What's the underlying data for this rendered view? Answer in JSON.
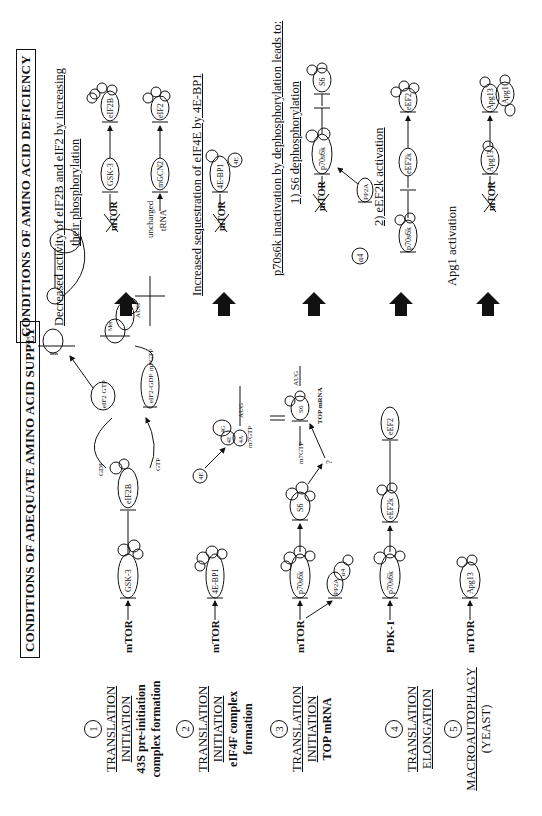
{
  "left_panel": {
    "title": "CONDITIONS OF ADEQUATE AMINO ACID SUPPLY",
    "sections": [
      {
        "number": "1",
        "line1": "TRANSLATION",
        "line2": "INITIATION",
        "bold1": "43S pre-initiation",
        "bold2": "complex formation"
      },
      {
        "number": "2",
        "line1": "TRANSLATION",
        "line2": "INITIATION",
        "bold1": "eIF4F complex",
        "bold2": "formation"
      },
      {
        "number": "3",
        "line1": "TRANSLATION",
        "line2": "INITIATION",
        "bold1": "TOP mRNA",
        "bold2": ""
      },
      {
        "number": "4",
        "line1": "TRANSLATION",
        "line2": "ELONGATION",
        "bold1": "",
        "bold2": ""
      },
      {
        "number": "5",
        "line1": "MACROAUTOPHAGY",
        "line2": "(YEAST)",
        "bold1": "",
        "bold2": ""
      }
    ],
    "pathways": {
      "row1": {
        "start": "mTOR",
        "kinase": "GSK-3",
        "target": "eIF2B",
        "gdp": "GDP",
        "gtp": "GTP",
        "eif2_gtp": "eIF2 GTP",
        "eif2_gdp": "eIF2-GDP",
        "met": "Met",
        "m7gtp": "m7GTP",
        "aug": "AUG"
      },
      "row2": {
        "start": "mTOR",
        "binder": "4E-BP1",
        "free_4e": "4E",
        "complex": [
          "4E",
          "4G",
          "4A"
        ],
        "m7gtp": "m7GTP",
        "aug": "AUG"
      },
      "row3": {
        "start": "mTOR",
        "kinase": "p70s6k",
        "phosphatase": "PP2A",
        "alpha4": "α4",
        "s6": "S6",
        "unknown": "?",
        "m7gtp": "m7GTP",
        "aug": "AUG",
        "mrna": "TOP mRNA"
      },
      "row4": {
        "start": "PDK-1",
        "kinase": "p70s6k",
        "eef2k": "eEF2k",
        "eef2": "eEF2"
      },
      "row5": {
        "start": "mTOR",
        "target": "Apg13"
      }
    },
    "phospho_label": "P"
  },
  "right_panel": {
    "title": "CONDITIONS OF AMINO ACID DEFICIENCY",
    "block1": {
      "heading1": "Decreased activity of eIF2B and eIF2 by increasing",
      "heading2": "their phosphorylation",
      "mtor": "mTOR",
      "gsk3": "GSK-3",
      "eif2b": "eIF2B",
      "uncharged": "uncharged",
      "trna": "tRNA",
      "mgcn2": "mGCN2",
      "eif2": "eIF2"
    },
    "block2": {
      "heading": "Increased sequestration of eIF4E by 4E-BP1",
      "mtor": "mTOR",
      "bp1": "4E-BP1",
      "e4": "4E"
    },
    "block3": {
      "heading": "p70s6k inactivation by dephosphorylation leads to:",
      "sub1": "1) S6 dephosphorylation",
      "mtor": "mTOR",
      "p70": "p70s6k",
      "s6": "S6",
      "pp2a": "PP2A",
      "alpha4": "α4",
      "sub2": "2) eEF2k activation",
      "p70b": "p70s6k",
      "eef2k": "eEF2k",
      "eef2": "eEF2"
    },
    "block4": {
      "heading": "Apg1 activation",
      "mtor": "mTOR",
      "apg13": "Apg13",
      "apg13b": "Apg13",
      "apg1": "Apg1"
    }
  }
}
